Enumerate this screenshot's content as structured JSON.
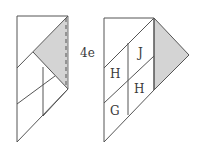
{
  "diagram": {
    "type": "quilt-folding-steps",
    "step_label": "4e",
    "colors": {
      "line": "#555555",
      "shade": "#d4d4d4",
      "background": "#ffffff"
    },
    "left_figure": {
      "description": "Strip with shaded triangle and dashed fold line",
      "labels": []
    },
    "right_figure": {
      "description": "Strip with shaded triangle folded out and labeled pieces",
      "labels": [
        "J",
        "H",
        "H",
        "G"
      ]
    }
  }
}
